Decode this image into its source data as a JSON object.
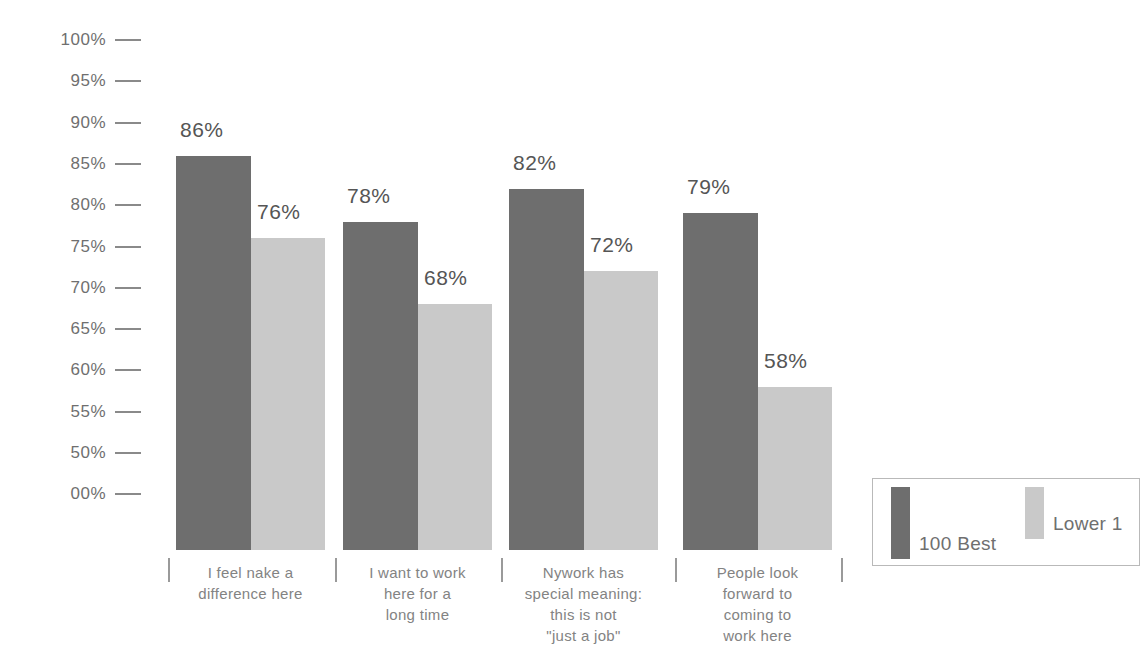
{
  "chart_data": {
    "type": "bar",
    "title": "",
    "subtitle": "",
    "xlabel": "",
    "ylabel": "",
    "grid": false,
    "legend_position": "bottom-right",
    "categories": [
      "I feel nake a\ndifference here",
      "I want to work\nhere for a\nlong time",
      "Nywork has\nspecial meaning:\nthis is not\n\"just a job\"",
      "People look\nforward to\ncoming to\nwork here"
    ],
    "series": [
      {
        "name": "100 Best",
        "color": "#6e6e6e",
        "values": [
          86,
          78,
          82,
          79
        ],
        "labels": [
          "86%",
          "78%",
          "82%",
          "79%"
        ]
      },
      {
        "name": "Lower 1",
        "color": "#c9c9c9",
        "values": [
          76,
          68,
          72,
          58
        ],
        "labels": [
          "76%",
          "68%",
          "72%",
          "58%"
        ]
      }
    ],
    "y_axis": {
      "ticks": [
        "100%",
        "95%",
        "90%",
        "85%",
        "80%",
        "75%",
        "70%",
        "65%",
        "60%",
        "55%",
        "50%",
        "00%"
      ],
      "tick_values": [
        100,
        95,
        90,
        85,
        80,
        75,
        70,
        65,
        60,
        55,
        50,
        45
      ],
      "ylim": [
        45,
        100
      ]
    }
  },
  "legend": {
    "items": [
      {
        "label": "100 Best",
        "color": "#6e6e6e"
      },
      {
        "label": "Lower 1",
        "color": "#c9c9c9"
      }
    ]
  }
}
